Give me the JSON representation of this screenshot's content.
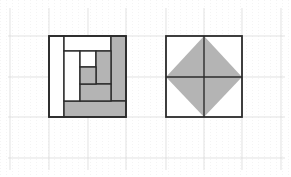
{
  "canvas": {
    "width": 291,
    "height": 177,
    "background": "#ffffff"
  },
  "colors": {
    "outline": "#2b2b2b",
    "shade": "#b4b4b4",
    "white": "#ffffff",
    "grid_light": "#d6d6d6",
    "grid_faint": "#e8e8e8"
  },
  "grid": {
    "major_horizontal_y": [
      36,
      77,
      117,
      158
    ],
    "major_vertical_x": [
      10,
      49,
      88,
      126,
      166,
      204,
      242,
      281
    ],
    "faint_step": 6
  },
  "figures": [
    {
      "id": "log-cabin-square",
      "description": "Square divided into nested rectangular strips (log cabin pattern), some shaded",
      "outer": {
        "x": 49,
        "y": 36,
        "w": 77,
        "h": 81
      },
      "regions": [
        {
          "name": "left-strip",
          "x": 49,
          "y": 36,
          "w": 15,
          "h": 81,
          "shaded": false
        },
        {
          "name": "top-strip",
          "x": 64,
          "y": 36,
          "w": 47,
          "h": 15,
          "shaded": false
        },
        {
          "name": "right-strip",
          "x": 111,
          "y": 36,
          "w": 15,
          "h": 65,
          "shaded": true
        },
        {
          "name": "bottom-strip",
          "x": 64,
          "y": 101,
          "w": 62,
          "h": 16,
          "shaded": true
        },
        {
          "name": "inner-left-strip",
          "x": 64,
          "y": 51,
          "w": 16,
          "h": 50,
          "shaded": false
        },
        {
          "name": "inner-top-strip",
          "x": 80,
          "y": 51,
          "w": 16,
          "h": 16,
          "shaded": false
        },
        {
          "name": "inner-right-strip",
          "x": 96,
          "y": 51,
          "w": 15,
          "h": 33,
          "shaded": true
        },
        {
          "name": "inner-bottom-strip",
          "x": 80,
          "y": 84,
          "w": 31,
          "h": 17,
          "shaded": true
        },
        {
          "name": "center-square",
          "x": 80,
          "y": 67,
          "w": 16,
          "h": 17,
          "shaded": true
        }
      ]
    },
    {
      "id": "diamond-square",
      "description": "Square split into four quadrants with a shaded diamond connecting edge midpoints",
      "outer": {
        "x": 166,
        "y": 36,
        "w": 76,
        "h": 81
      },
      "midlines": {
        "x": 204,
        "y": 77
      },
      "diamond": [
        [
          166,
          77
        ],
        [
          204,
          36
        ],
        [
          242,
          77
        ],
        [
          204,
          117
        ]
      ],
      "shaded": true
    }
  ]
}
